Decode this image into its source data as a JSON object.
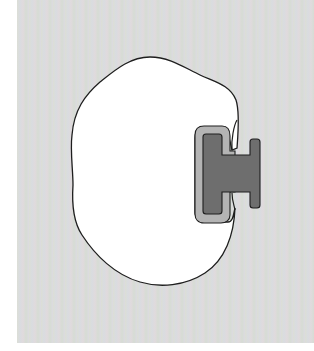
{
  "figure": {
    "colors": {
      "background_panel": "#dbdcda",
      "body_fill": "#ffffff",
      "outline": "#1e1e1e",
      "halo_fill": "#b4b4b4",
      "h_shape_fill": "#6e6e6e"
    },
    "labels": []
  }
}
